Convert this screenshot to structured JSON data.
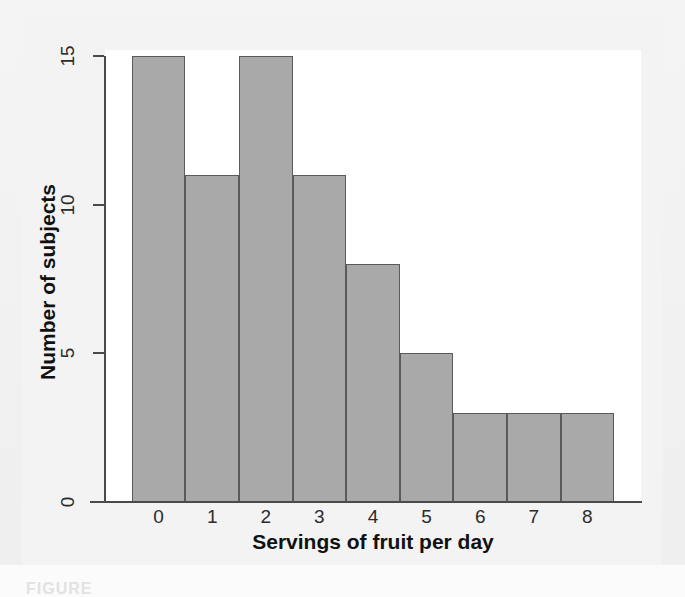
{
  "figure": {
    "caption_partial": "FIGURE",
    "background_color": "#f2f2f2",
    "panel_color": "#ffffff"
  },
  "chart_data": {
    "type": "bar",
    "title": "",
    "subtitle": "",
    "xlabel": "Servings of fruit per day",
    "ylabel": "Number of subjects",
    "categories": [
      "0",
      "1",
      "2",
      "3",
      "4",
      "5",
      "6",
      "7",
      "8"
    ],
    "values": [
      15,
      11,
      15,
      11,
      8,
      5,
      3,
      3,
      3
    ],
    "x_tick_labels": [
      "0",
      "1",
      "2",
      "3",
      "4",
      "5",
      "6",
      "7",
      "8"
    ],
    "y_tick_labels": [
      "0",
      "5",
      "10",
      "15"
    ],
    "y_tick_values": [
      0,
      5,
      10,
      15
    ],
    "ylim": [
      0,
      15
    ],
    "xlim": [
      -0.5,
      8.5
    ],
    "grid": false,
    "legend": false,
    "legend_position": "none",
    "bar_fill_color": "#a9a9a9",
    "bar_edge_color": "#5a5a5a",
    "axis_color": "#4a4a4a",
    "text_color": "#111111",
    "y_tick_label_rotation": -90,
    "total_subjects": 74
  }
}
